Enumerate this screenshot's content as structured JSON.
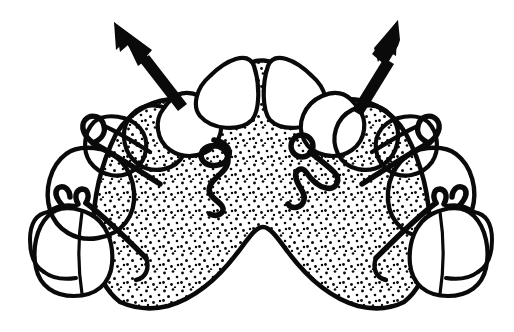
{
  "figure": {
    "title": "Maxillary removable expansion appliance (occlusal view)",
    "background_color": "#ffffff",
    "ink_color": "#0a0a0a",
    "stipple_color": "#0a0a0a",
    "style": "black-and-white stippled line art",
    "has_labels": false,
    "has_text": false,
    "label_text": ""
  },
  "arrows": [
    {
      "name": "left-expansion-arrow",
      "direction": "up-left",
      "angle_degrees": 235,
      "tail": [
        180,
        107
      ],
      "tip": [
        114,
        22
      ],
      "shaft_width": 7,
      "head_length": 30,
      "head_width": 24,
      "meaning": "direction of expansion, left posterior segment"
    },
    {
      "name": "right-expansion-arrow",
      "direction": "up-right",
      "angle_degrees": 305,
      "tail": [
        348,
        105
      ],
      "tip": [
        398,
        20
      ],
      "shaft_width": 7,
      "head_length": 30,
      "head_width": 24,
      "meaning": "direction of expansion, right posterior segment"
    }
  ],
  "appliance": {
    "name": "upper removable appliance",
    "baseplate": {
      "name": "acrylic-baseplate",
      "material": "stippled acrylic",
      "fill": "stipple",
      "posterior_border_shape": "double-scalloped M curve",
      "dot_spacing_px": 9,
      "dot_radius_px": 1.5
    },
    "components": [
      {
        "name": "left-premolar-adams-clasp",
        "type": "Adams clasp",
        "side": "left",
        "position": "first premolar"
      },
      {
        "name": "left-molar-adams-clasp",
        "type": "Adams clasp",
        "side": "left",
        "position": "first molar"
      },
      {
        "name": "right-premolar-adams-clasp",
        "type": "Adams clasp",
        "side": "right",
        "position": "first premolar"
      },
      {
        "name": "right-molar-adams-clasp",
        "type": "Adams clasp",
        "side": "right",
        "position": "first molar"
      },
      {
        "name": "left-z-spring",
        "type": "Z-spring / double cantilever spring",
        "side": "left",
        "acts_on": "upper left lateral incisor"
      },
      {
        "name": "right-z-spring",
        "type": "Z-spring / double cantilever spring",
        "side": "right",
        "acts_on": "upper right lateral incisor"
      },
      {
        "name": "right-spring-coil",
        "type": "helical coil",
        "side": "right"
      }
    ]
  },
  "teeth": {
    "arch": "maxillary",
    "view": "occlusal",
    "count_drawn": 12,
    "uncovered_teeth": [
      {
        "name": "upper-right-central-incisor",
        "shaded": false
      },
      {
        "name": "upper-left-central-incisor",
        "shaded": false
      },
      {
        "name": "upper-right-lateral-incisor",
        "shaded": false
      },
      {
        "name": "upper-left-lateral-incisor",
        "shaded": false
      },
      {
        "name": "upper-right-second-molar",
        "shaded": false
      },
      {
        "name": "upper-left-second-molar",
        "shaded": false
      }
    ],
    "covered_teeth": [
      {
        "name": "upper-right-canine",
        "shaded": true
      },
      {
        "name": "upper-left-canine",
        "shaded": true
      },
      {
        "name": "upper-right-first-premolar",
        "shaded": true
      },
      {
        "name": "upper-left-first-premolar",
        "shaded": true
      },
      {
        "name": "upper-right-first-molar",
        "shaded": true
      },
      {
        "name": "upper-left-first-molar",
        "shaded": true
      }
    ],
    "midline_diastema_present": true
  }
}
